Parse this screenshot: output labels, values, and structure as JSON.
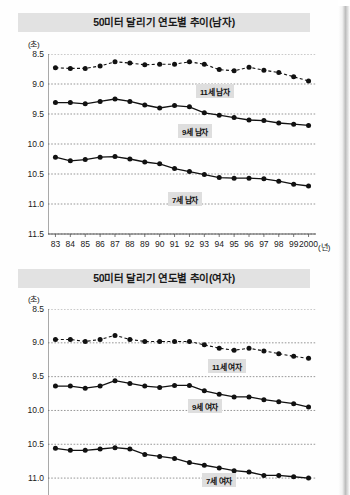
{
  "page": {
    "background_color": "#ffffff",
    "title_bar_color": "#e2e2e2"
  },
  "charts": [
    {
      "id": "chart1",
      "title": "50미터 달리기 연도별 추이(남자)",
      "y_unit": "(초)",
      "x_unit": "(년)",
      "y_ticks": [
        "8.5",
        "9.0",
        "9.5",
        "10.0",
        "10.5",
        "11.0",
        "11.5"
      ],
      "x_ticks": [
        "83",
        "84",
        "85",
        "86",
        "87",
        "88",
        "89",
        "90",
        "91",
        "92",
        "93",
        "94",
        "95",
        "96",
        "97",
        "98",
        "99",
        "2000"
      ],
      "series_labels": [
        "11세 남자",
        "9세 남자",
        "7세 남자"
      ]
    },
    {
      "id": "chart2",
      "title": "50미터 달리기 연도별 추이(여자)",
      "y_unit": "(초)",
      "x_unit": "(년)",
      "y_ticks": [
        "8.5",
        "9.0",
        "9.5",
        "10.0",
        "10.5",
        "11.0"
      ],
      "x_ticks": [
        "83",
        "84",
        "85",
        "86",
        "87",
        "88",
        "89",
        "90",
        "91",
        "92",
        "93",
        "94",
        "95",
        "96",
        "97",
        "98",
        "99",
        "2000"
      ],
      "series_labels": [
        "11세 여자",
        "9세 여자",
        "7세 여자"
      ]
    }
  ],
  "chart_data": [
    {
      "type": "line",
      "title": "50미터 달리기 연도별 추이(남자)",
      "xlabel": "(년)",
      "ylabel": "(초)",
      "x": [
        "83",
        "84",
        "85",
        "86",
        "87",
        "88",
        "89",
        "90",
        "91",
        "92",
        "93",
        "94",
        "95",
        "96",
        "97",
        "98",
        "99",
        "2000"
      ],
      "ylim": [
        8.5,
        11.5
      ],
      "y_inverted": true,
      "y_ticks": [
        8.5,
        9.0,
        9.5,
        10.0,
        10.5,
        11.0,
        11.5
      ],
      "grid": true,
      "legend": "inline-labels",
      "series": [
        {
          "name": "11세 남자",
          "style": "dashed",
          "values": [
            8.73,
            8.74,
            8.74,
            8.7,
            8.63,
            8.65,
            8.68,
            8.67,
            8.67,
            8.63,
            8.67,
            8.76,
            8.78,
            8.72,
            8.77,
            8.81,
            8.88,
            8.95
          ]
        },
        {
          "name": "9세 남자",
          "style": "solid",
          "values": [
            9.31,
            9.31,
            9.33,
            9.29,
            9.25,
            9.29,
            9.35,
            9.4,
            9.36,
            9.38,
            9.48,
            9.52,
            9.56,
            9.6,
            9.61,
            9.65,
            9.67,
            9.69
          ]
        },
        {
          "name": "7세 남자",
          "style": "solid",
          "values": [
            10.22,
            10.28,
            10.26,
            10.22,
            10.21,
            10.25,
            10.3,
            10.33,
            10.41,
            10.46,
            10.51,
            10.56,
            10.57,
            10.57,
            10.58,
            10.62,
            10.67,
            10.7
          ]
        }
      ]
    },
    {
      "type": "line",
      "title": "50미터 달리기 연도별 추이(여자)",
      "xlabel": "(년)",
      "ylabel": "(초)",
      "x": [
        "83",
        "84",
        "85",
        "86",
        "87",
        "88",
        "89",
        "90",
        "91",
        "92",
        "93",
        "94",
        "95",
        "96",
        "97",
        "98",
        "99",
        "2000"
      ],
      "ylim": [
        8.5,
        11.25
      ],
      "y_inverted": true,
      "y_ticks": [
        8.5,
        9.0,
        9.5,
        10.0,
        10.5,
        11.0
      ],
      "grid": true,
      "legend": "inline-labels",
      "series": [
        {
          "name": "11세 여자",
          "style": "dashed",
          "values": [
            8.95,
            8.95,
            8.98,
            8.95,
            8.89,
            8.95,
            8.98,
            8.98,
            8.98,
            8.98,
            9.03,
            9.08,
            9.11,
            9.08,
            9.12,
            9.16,
            9.2,
            9.23
          ]
        },
        {
          "name": "9세 여자",
          "style": "solid",
          "values": [
            9.64,
            9.64,
            9.67,
            9.64,
            9.56,
            9.6,
            9.64,
            9.66,
            9.63,
            9.63,
            9.71,
            9.76,
            9.8,
            9.8,
            9.84,
            9.87,
            9.9,
            9.95
          ]
        },
        {
          "name": "7세 여자",
          "style": "solid",
          "values": [
            10.56,
            10.59,
            10.59,
            10.57,
            10.55,
            10.57,
            10.65,
            10.68,
            10.71,
            10.77,
            10.81,
            10.85,
            10.89,
            10.91,
            10.96,
            10.96,
            10.98,
            11.0
          ]
        }
      ]
    }
  ]
}
